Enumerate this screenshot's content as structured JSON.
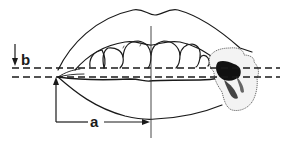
{
  "figure": {
    "type": "anatomical-line-drawing",
    "colors": {
      "line": "#1a1a1a",
      "lesion_dark": "#111111",
      "background": "#ffffff"
    }
  },
  "labels": {
    "a": "a",
    "b": "b"
  },
  "measurements": [
    {
      "id": "a",
      "description": "horizontal distance from left mouth corner to midline",
      "label": "a"
    },
    {
      "id": "b",
      "description": "vertical offset between the two dashed reference lines",
      "label": "b"
    }
  ],
  "reference_lines": [
    {
      "id": "upper-dashed",
      "style": "dashed"
    },
    {
      "id": "lower-dashed",
      "style": "dashed"
    },
    {
      "id": "midline",
      "style": "solid"
    }
  ]
}
